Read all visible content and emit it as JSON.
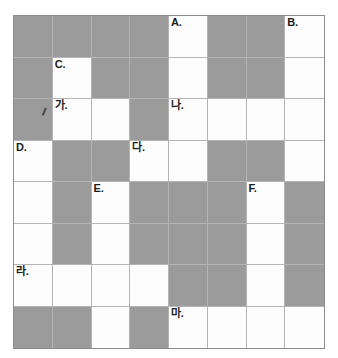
{
  "page": {
    "top_clipped_text": "가 가 가 가 가 가 가 가 가 가 가 가 가 가 가 가 가 가 가 가 가",
    "colors": {
      "block": "#9b9b9b",
      "empty": "#fdfdfd",
      "grid_line": "#b4b4b4",
      "grid_border": "#8c8c8c",
      "label_text": "#1b1b1b"
    }
  },
  "puzzle": {
    "columns": 8,
    "rows": 8,
    "legend": {
      "white": "empty answer cell",
      "block": "shaded blocked cell"
    },
    "grid": [
      [
        {
          "type": "block",
          "label": ""
        },
        {
          "type": "block",
          "label": ""
        },
        {
          "type": "block",
          "label": ""
        },
        {
          "type": "block",
          "label": ""
        },
        {
          "type": "white",
          "label": "A."
        },
        {
          "type": "block",
          "label": ""
        },
        {
          "type": "block",
          "label": ""
        },
        {
          "type": "white",
          "label": "B."
        }
      ],
      [
        {
          "type": "block",
          "label": ""
        },
        {
          "type": "white",
          "label": "C."
        },
        {
          "type": "block",
          "label": ""
        },
        {
          "type": "block",
          "label": ""
        },
        {
          "type": "white",
          "label": ""
        },
        {
          "type": "block",
          "label": ""
        },
        {
          "type": "block",
          "label": ""
        },
        {
          "type": "white",
          "label": ""
        }
      ],
      [
        {
          "type": "block",
          "label": ""
        },
        {
          "type": "white",
          "label": "가."
        },
        {
          "type": "white",
          "label": ""
        },
        {
          "type": "block",
          "label": ""
        },
        {
          "type": "white",
          "label": "나."
        },
        {
          "type": "white",
          "label": ""
        },
        {
          "type": "white",
          "label": ""
        },
        {
          "type": "white",
          "label": ""
        }
      ],
      [
        {
          "type": "white",
          "label": "D."
        },
        {
          "type": "block",
          "label": ""
        },
        {
          "type": "block",
          "label": ""
        },
        {
          "type": "white",
          "label": "다."
        },
        {
          "type": "white",
          "label": ""
        },
        {
          "type": "block",
          "label": ""
        },
        {
          "type": "block",
          "label": ""
        },
        {
          "type": "white",
          "label": ""
        }
      ],
      [
        {
          "type": "white",
          "label": ""
        },
        {
          "type": "block",
          "label": ""
        },
        {
          "type": "white",
          "label": "E."
        },
        {
          "type": "block",
          "label": ""
        },
        {
          "type": "block",
          "label": ""
        },
        {
          "type": "block",
          "label": ""
        },
        {
          "type": "white",
          "label": "F."
        },
        {
          "type": "block",
          "label": ""
        }
      ],
      [
        {
          "type": "white",
          "label": ""
        },
        {
          "type": "block",
          "label": ""
        },
        {
          "type": "white",
          "label": ""
        },
        {
          "type": "block",
          "label": ""
        },
        {
          "type": "block",
          "label": ""
        },
        {
          "type": "block",
          "label": ""
        },
        {
          "type": "white",
          "label": ""
        },
        {
          "type": "block",
          "label": ""
        }
      ],
      [
        {
          "type": "white",
          "label": "라."
        },
        {
          "type": "white",
          "label": ""
        },
        {
          "type": "white",
          "label": ""
        },
        {
          "type": "white",
          "label": ""
        },
        {
          "type": "block",
          "label": ""
        },
        {
          "type": "block",
          "label": ""
        },
        {
          "type": "white",
          "label": ""
        },
        {
          "type": "block",
          "label": ""
        }
      ],
      [
        {
          "type": "block",
          "label": ""
        },
        {
          "type": "block",
          "label": ""
        },
        {
          "type": "white",
          "label": ""
        },
        {
          "type": "block",
          "label": ""
        },
        {
          "type": "white",
          "label": "마."
        },
        {
          "type": "white",
          "label": ""
        },
        {
          "type": "white",
          "label": ""
        },
        {
          "type": "white",
          "label": ""
        }
      ]
    ],
    "annotations": [
      {
        "kind": "pencil-mark",
        "row": 2,
        "col": 0,
        "description": "small handwritten pencil tick"
      }
    ]
  }
}
